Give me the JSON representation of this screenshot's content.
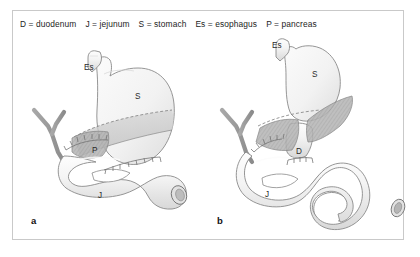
{
  "figure": {
    "border_color": "#c9c9c9",
    "background": "#ffffff"
  },
  "legend": {
    "entries": [
      "D = duodenum",
      "J = jejunum",
      "S = stomach",
      "Es = esophagus",
      "P = pancreas"
    ]
  },
  "panels": [
    {
      "letter": "a",
      "labels": {
        "esophagus": "Es",
        "stomach": "S",
        "pancreas": "P",
        "jejunum": "J"
      }
    },
    {
      "letter": "b",
      "labels": {
        "esophagus": "Es",
        "stomach": "S",
        "duodenum": "D",
        "jejunum": "J"
      }
    }
  ],
  "colors": {
    "organ_fill": "#f4f4f4",
    "organ_outline": "#8c8c8c",
    "pancreas_fill": "#a9a9a9",
    "vessel": "#9a9a9a",
    "shadow_band": "#cccccc",
    "text": "#1d1d1d"
  }
}
